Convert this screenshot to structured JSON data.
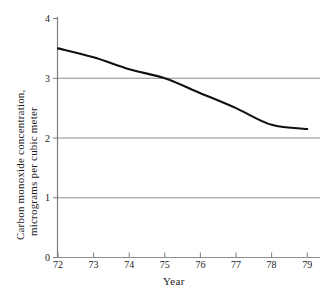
{
  "chart_data": {
    "type": "line",
    "title": "",
    "xlabel": "Year",
    "ylabel": "Carbon monoxide concentration, micrograms per cubic meter",
    "ylabel_line1": "Carbon monoxide concentration,",
    "ylabel_line2": "micrograms per cubic meter",
    "x": [
      72,
      73,
      74,
      75,
      76,
      77,
      78,
      79
    ],
    "categories": [
      "72",
      "73",
      "74",
      "75",
      "76",
      "77",
      "78",
      "79"
    ],
    "values": [
      3.5,
      3.35,
      3.15,
      3.0,
      2.75,
      2.5,
      2.22,
      2.15
    ],
    "series": [
      {
        "name": "Carbon monoxide concentration",
        "values": [
          3.5,
          3.35,
          3.15,
          3.0,
          2.75,
          2.5,
          2.22,
          2.15
        ]
      }
    ],
    "xlim": [
      72,
      79
    ],
    "ylim": [
      0,
      4
    ],
    "xticks": [
      "72",
      "73",
      "74",
      "75",
      "76",
      "77",
      "78",
      "79"
    ],
    "yticks": [
      "0",
      "1",
      "2",
      "3",
      "4"
    ],
    "gridlines_y": [
      "1",
      "2",
      "3"
    ],
    "grid": true,
    "legend": "none",
    "line_color": "#111111",
    "grid_color": "#8d8d8d",
    "axis_color": "#7d7d7d",
    "background_color": "#ffffff"
  },
  "axes": {
    "y_tick_values": [
      4,
      3,
      2,
      1,
      0
    ],
    "x_tick_values": [
      72,
      73,
      74,
      75,
      76,
      77,
      78,
      79
    ]
  }
}
